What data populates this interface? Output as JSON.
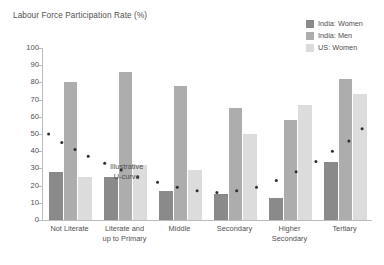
{
  "chart_data": {
    "type": "bar",
    "title": "Labour Force Participation Rate (%)",
    "xlabel": "",
    "ylabel": "",
    "ylim": [
      0,
      100
    ],
    "yticks": [
      0,
      10,
      20,
      30,
      40,
      50,
      60,
      70,
      80,
      90,
      100
    ],
    "grid": false,
    "legend_position": "top-right",
    "categories": [
      "Not Literate",
      "Literate and up to Primary",
      "Middle",
      "Secondary",
      "Higher Secondary",
      "Tertiary"
    ],
    "category_lines": [
      [
        "Not Literate"
      ],
      [
        "Literate and",
        "up to Primary"
      ],
      [
        "Middle"
      ],
      [
        "Secondary"
      ],
      [
        "Higher",
        "Secondary"
      ],
      [
        "Tertiary"
      ]
    ],
    "series": [
      {
        "name": "India: Women",
        "color": "#8a8a8a",
        "values": [
          28,
          25,
          17,
          15,
          13,
          34
        ]
      },
      {
        "name": "India: Men",
        "color": "#adadad",
        "values": [
          80,
          86,
          78,
          65,
          58,
          82
        ]
      },
      {
        "name": "US: Women",
        "color": "#dcdcdc",
        "values": [
          25,
          32,
          29,
          50,
          67,
          73
        ]
      }
    ],
    "annotations": [
      {
        "name": "illustrative-u-curve",
        "lines": [
          "Illustrative",
          "U-curve"
        ],
        "curve_points": [
          [
            0.02,
            50
          ],
          [
            0.06,
            45
          ],
          [
            0.1,
            41
          ],
          [
            0.14,
            37
          ],
          [
            0.19,
            33
          ],
          [
            0.24,
            29
          ],
          [
            0.29,
            25
          ],
          [
            0.35,
            22
          ],
          [
            0.41,
            19
          ],
          [
            0.47,
            17
          ],
          [
            0.53,
            16
          ],
          [
            0.59,
            17
          ],
          [
            0.65,
            19
          ],
          [
            0.71,
            23
          ],
          [
            0.77,
            28
          ],
          [
            0.83,
            34
          ],
          [
            0.88,
            40
          ],
          [
            0.93,
            46
          ],
          [
            0.97,
            53
          ]
        ]
      }
    ]
  },
  "chart": {
    "title": "Labour Force Participation Rate (%)"
  },
  "legend": {
    "items": [
      {
        "label": "India: Women",
        "color": "#8a8a8a"
      },
      {
        "label": "India: Men",
        "color": "#adadad"
      },
      {
        "label": "US: Women",
        "color": "#dcdcdc"
      }
    ]
  },
  "annotation": {
    "line1": "Illustrative",
    "line2": "U-curve"
  },
  "colors": {
    "axis": "#bcbcbc",
    "text": "#4f4f4f",
    "background": "#ffffff",
    "curve_dot": "#2e2e2e"
  }
}
